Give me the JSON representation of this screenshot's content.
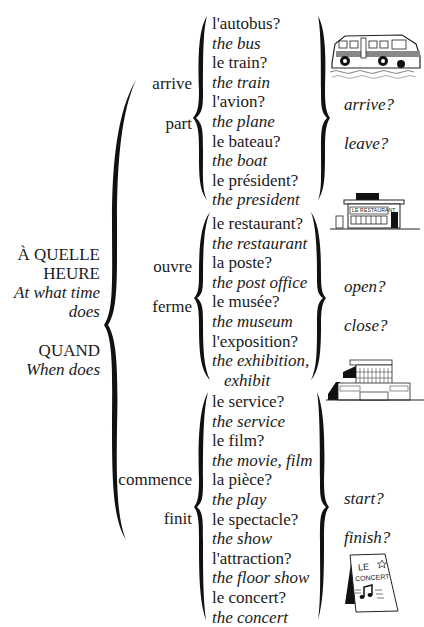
{
  "question_words": {
    "a_quelle_heure_line1": "À QUELLE",
    "a_quelle_heure_line2": "HEURE",
    "a_quelle_heure_en_line1": "At what time",
    "a_quelle_heure_en_line2": "does",
    "quand": "QUAND",
    "quand_en": "When does"
  },
  "groups": [
    {
      "verbs": [
        {
          "fr": "arrive"
        },
        {
          "fr": "part"
        }
      ],
      "translations": [
        "arrive?",
        "leave?"
      ],
      "items": [
        {
          "fr": "l'autobus?",
          "en": "the bus"
        },
        {
          "fr": "le train?",
          "en": "the train"
        },
        {
          "fr": "l'avion?",
          "en": "the plane"
        },
        {
          "fr": "le bateau?",
          "en": "the boat"
        },
        {
          "fr": "le président?",
          "en": "the president"
        }
      ],
      "illustration": "bus-illustration"
    },
    {
      "verbs": [
        {
          "fr": "ouvre"
        },
        {
          "fr": "ferme"
        }
      ],
      "translations": [
        "open?",
        "close?"
      ],
      "items": [
        {
          "fr": "le restaurant?",
          "en": "the restaurant"
        },
        {
          "fr": "la poste?",
          "en": "the post office"
        },
        {
          "fr": "le musée?",
          "en": "the museum"
        },
        {
          "fr": "l'exposition?",
          "en": "the exhibition,",
          "en2": "exhibit"
        }
      ],
      "illustration": "restaurant-illustration"
    },
    {
      "verbs": [
        {
          "fr": "commence"
        },
        {
          "fr": "finit"
        }
      ],
      "translations": [
        "start?",
        "finish?"
      ],
      "items": [
        {
          "fr": "le service?",
          "en": "the service"
        },
        {
          "fr": "le film?",
          "en": "the movie, film"
        },
        {
          "fr": "la pièce?",
          "en": "the play"
        },
        {
          "fr": "le spectacle?",
          "en": "the show"
        },
        {
          "fr": "l'attraction?",
          "en": "the floor show"
        },
        {
          "fr": "le concert?",
          "en": "the concert"
        }
      ],
      "illustration": "concert-poster-illustration"
    }
  ],
  "illustrations": {
    "restaurant_sign": "LE RESTAURANT",
    "concert_le": "LE",
    "concert_word": "CONCERT"
  }
}
